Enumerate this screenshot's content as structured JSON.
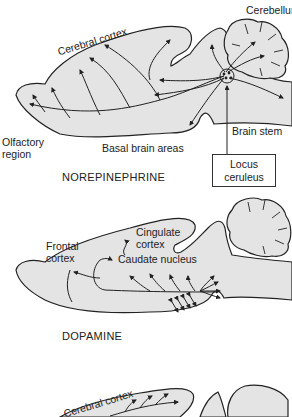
{
  "panels": [
    {
      "caption": "NOREPINEPHRINE",
      "labels": {
        "cerebellum": "Cerebellum",
        "cerebral_cortex": "Cerebral cortex",
        "olfactory_region": "Olfactory\nregion",
        "olfactory_line1": "Olfactory",
        "olfactory_line2": "region",
        "basal_brain_areas": "Basal brain areas",
        "brain_stem": "Brain stem",
        "locus_line1": "Locus",
        "locus_line2": "ceruleus"
      }
    },
    {
      "caption": "DOPAMINE",
      "labels": {
        "frontal_line1": "Frontal",
        "frontal_line2": "cortex",
        "cingulate_line1": "Cingulate",
        "cingulate_line2": "cortex",
        "caudate_nucleus": "Caudate nucleus"
      }
    },
    {
      "caption": "",
      "labels": {
        "cerebral_cortex": "Cerebral cortex"
      }
    }
  ],
  "colors": {
    "brain_fill": "#e4e4e4",
    "outline": "#222222",
    "background": "#ffffff"
  }
}
